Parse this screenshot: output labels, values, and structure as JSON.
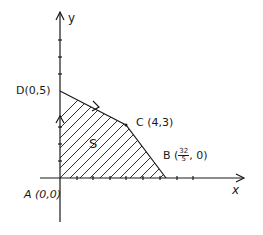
{
  "diagram": {
    "type": "feasible-region",
    "axes": {
      "x_label": "x",
      "y_label": "y"
    },
    "region_label": "S",
    "vertices": [
      {
        "name": "A",
        "label": "A (0,0)",
        "x": 0,
        "y": 0
      },
      {
        "name": "B",
        "label_prefix": "B (",
        "frac_num": "32",
        "frac_den": "5",
        "label_suffix": ", 0)",
        "x": 6.4,
        "y": 0
      },
      {
        "name": "C",
        "label": "C (4,3)",
        "x": 4,
        "y": 3
      },
      {
        "name": "D",
        "label": "D(0,5)",
        "x": 0,
        "y": 5
      }
    ],
    "colors": {
      "ink": "#1a1a1a",
      "background": "#ffffff"
    }
  }
}
